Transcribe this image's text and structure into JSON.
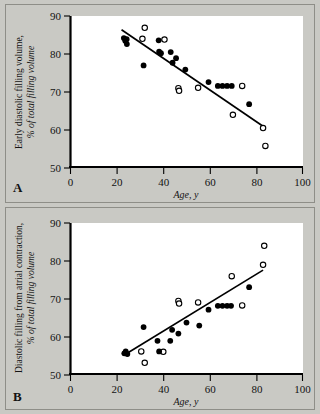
{
  "figure": {
    "background_color": "#c9c9c4",
    "plot_background_color": "#ffffff",
    "axis_color": "#000000",
    "marker_filled_color": "#000000",
    "marker_open_color": "#ffffff",
    "line_color": "#000000"
  },
  "panels": [
    {
      "letter": "A",
      "ylabel_line1": "Early diastolic filling volume,",
      "ylabel_line2": "% of total filling volume",
      "xlabel": "Age, y"
    },
    {
      "letter": "B",
      "ylabel_line1": "Diastolic filling from atrial contraction,",
      "ylabel_line2": "% of total filling volume",
      "xlabel": "Age, y"
    }
  ],
  "chart_data": [
    {
      "type": "scatter",
      "panel": "A",
      "title": "",
      "xlabel": "Age, y",
      "ylabel": "Early diastolic filling volume, % of total filling volume",
      "xlim": [
        0,
        100
      ],
      "ylim": [
        50,
        90
      ],
      "xticks": [
        0,
        20,
        40,
        60,
        80,
        100
      ],
      "yticks": [
        50,
        60,
        70,
        80,
        90
      ],
      "xtick_labels": [
        "0",
        "20",
        "40",
        "60",
        "80",
        "100"
      ],
      "ytick_labels": [
        "50",
        "60",
        "70",
        "80",
        "90"
      ],
      "grid": false,
      "legend": "none",
      "series": [
        {
          "name": "filled",
          "marker": "filled-circle",
          "points": [
            [
              23.0,
              84.2
            ],
            [
              23.6,
              83.5
            ],
            [
              24.2,
              83.9
            ],
            [
              24.3,
              82.6
            ],
            [
              31.5,
              77.0
            ],
            [
              38.0,
              83.6
            ],
            [
              38.2,
              80.6
            ],
            [
              39.0,
              80.2
            ],
            [
              43.2,
              80.5
            ],
            [
              44.0,
              77.7
            ],
            [
              45.5,
              78.9
            ],
            [
              49.5,
              75.9
            ],
            [
              59.5,
              72.6
            ],
            [
              63.5,
              71.6
            ],
            [
              65.5,
              71.6
            ],
            [
              67.5,
              71.6
            ],
            [
              69.5,
              71.6
            ],
            [
              77.0,
              66.8
            ]
          ]
        },
        {
          "name": "open",
          "marker": "open-circle",
          "points": [
            [
              32.0,
              86.9
            ],
            [
              31.0,
              84.0
            ],
            [
              40.5,
              83.8
            ],
            [
              46.5,
              71.0
            ],
            [
              46.8,
              70.3
            ],
            [
              55.0,
              71.1
            ],
            [
              70.0,
              64.0
            ],
            [
              74.0,
              71.6
            ],
            [
              83.0,
              60.5
            ],
            [
              84.0,
              55.8
            ]
          ]
        }
      ],
      "regression_line": {
        "x": [
          22.0,
          83.0
        ],
        "y": [
          86.4,
          61.0
        ],
        "slope": -0.416,
        "intercept": 95.6
      }
    },
    {
      "type": "scatter",
      "panel": "B",
      "title": "",
      "xlabel": "Age, y",
      "ylabel": "Diastolic filling from atrial contraction, % of total filling volume",
      "xlim": [
        0,
        100
      ],
      "ylim": [
        50,
        90
      ],
      "xticks": [
        0,
        20,
        40,
        60,
        80,
        100
      ],
      "yticks": [
        50,
        60,
        70,
        80,
        90
      ],
      "xtick_labels": [
        "0",
        "20",
        "40",
        "60",
        "80",
        "100"
      ],
      "ytick_labels": [
        "50",
        "60",
        "70",
        "80",
        "90"
      ],
      "grid": false,
      "legend": "none",
      "series": [
        {
          "name": "filled",
          "marker": "filled-circle",
          "points": [
            [
              23.2,
              55.7
            ],
            [
              23.8,
              56.2
            ],
            [
              24.5,
              55.5
            ],
            [
              31.5,
              62.6
            ],
            [
              37.5,
              59.0
            ],
            [
              38.2,
              56.2
            ],
            [
              43.0,
              59.0
            ],
            [
              43.8,
              61.9
            ],
            [
              46.5,
              60.9
            ],
            [
              50.0,
              63.8
            ],
            [
              55.5,
              63.0
            ],
            [
              59.5,
              67.2
            ],
            [
              63.5,
              68.2
            ],
            [
              65.5,
              68.2
            ],
            [
              67.5,
              68.2
            ],
            [
              69.2,
              68.2
            ],
            [
              77.0,
              73.1
            ]
          ]
        },
        {
          "name": "open",
          "marker": "open-circle",
          "points": [
            [
              30.5,
              56.2
            ],
            [
              32.0,
              53.2
            ],
            [
              40.0,
              56.1
            ],
            [
              46.5,
              69.5
            ],
            [
              46.8,
              68.8
            ],
            [
              55.0,
              69.1
            ],
            [
              69.5,
              76.0
            ],
            [
              74.0,
              68.3
            ],
            [
              83.5,
              84.0
            ],
            [
              83.0,
              79.0
            ]
          ]
        }
      ],
      "regression_line": {
        "x": [
          23.0,
          83.0
        ],
        "y": [
          55.2,
          77.6
        ],
        "slope": 0.373,
        "intercept": 46.6
      }
    }
  ]
}
